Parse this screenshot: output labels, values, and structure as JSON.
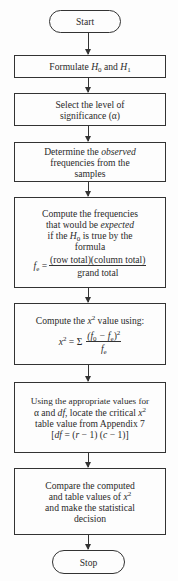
{
  "flowchart": {
    "title": "Chi-square test procedure flowchart",
    "start": {
      "label": "Start"
    },
    "steps": [
      {
        "id": "formulate",
        "pre": "Formulate ",
        "h0": "H",
        "h0_sub": "0",
        "mid": " and ",
        "h1": "H",
        "h1_sub": "1"
      },
      {
        "id": "select",
        "line1": "Select the level of",
        "line2": "significance (α)"
      },
      {
        "id": "determine",
        "line1_pre": "Determine the ",
        "line1_em": "observed",
        "line2": "frequencies from the",
        "line3": "samples"
      },
      {
        "id": "expected",
        "line1": "Compute the frequencies",
        "line2_pre": "that would be ",
        "line2_em": "expected",
        "line3_pre": "if the ",
        "line3_h": "H",
        "line3_sub": "0",
        "line3_post": " is true by the",
        "line4": "formula",
        "formula_lhs": "f",
        "formula_lhs_sub": "e",
        "formula_eq": " =",
        "formula_num": "(row total)(column total)",
        "formula_den": "grand total"
      },
      {
        "id": "compute_chi",
        "line1_pre": "Compute the ",
        "line1_x": "x",
        "line1_sup": "2",
        "line1_post": " value using:",
        "formula_lhs": "x",
        "formula_lhs_sup": "2",
        "formula_eq": " = Σ",
        "num_open": "(f",
        "num_sub0": "0",
        "num_mid": " − f",
        "num_sube": "e",
        "num_close": ")",
        "num_sup": "2",
        "den": "f",
        "den_sub": "e"
      },
      {
        "id": "locate",
        "line1": "Using the appropriate values for",
        "line2_a": "α and ",
        "line2_df": "df",
        "line2_post": ", locate the critical ",
        "line2_x": "x",
        "line2_sup": "2",
        "line3": "table value from Appendix 7",
        "line4_open": "[",
        "line4_df": "df",
        "line4_eq": " = (",
        "line4_r": "r",
        "line4_mid": " − 1) (",
        "line4_c": "c",
        "line4_close": " − 1)]"
      },
      {
        "id": "compare",
        "line1": "Compare the computed",
        "line2_pre": "and table values of ",
        "line2_x": "x",
        "line2_sup": "2",
        "line3": "and make the statistical",
        "line4": "decision"
      }
    ],
    "stop": {
      "label": "Stop"
    }
  },
  "colors": {
    "stroke": "#333333",
    "background": "#fdfdfd",
    "text": "#2a2a2a"
  }
}
